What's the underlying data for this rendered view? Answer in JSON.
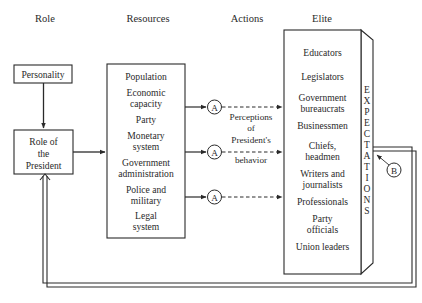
{
  "headers": {
    "role": "Role",
    "resources": "Resources",
    "actions": "Actions",
    "elite": "Elite"
  },
  "role": {
    "personality": "Personality",
    "president_lines": [
      "Role of",
      "the",
      "President"
    ]
  },
  "resources": {
    "items": [
      [
        "Population"
      ],
      [
        "Economic",
        "capacity"
      ],
      [
        "Party"
      ],
      [
        "Monetary",
        "system"
      ],
      [
        "Government",
        "administration"
      ],
      [
        "Police and",
        "military"
      ],
      [
        "Legal",
        "system"
      ]
    ]
  },
  "actions": {
    "node_label": "A",
    "perceptions_lines": [
      "Perceptions",
      "of",
      "President's",
      "behavior"
    ]
  },
  "elite": {
    "items": [
      [
        "Educators"
      ],
      [
        "Legislators"
      ],
      [
        "Government",
        "bureaucrats"
      ],
      [
        "Businessmen"
      ],
      [
        "Chiefs,",
        "headmen"
      ],
      [
        "Writers and",
        "journalists"
      ],
      [
        "Professionals"
      ],
      [
        "Party",
        "officials"
      ],
      [
        "Union leaders"
      ]
    ],
    "side_label": "EXPECTATIONS",
    "side_letters": [
      "E",
      "X",
      "P",
      "E",
      "C",
      "T",
      "A",
      "T",
      "I",
      "O",
      "N",
      "S"
    ]
  },
  "feedback": {
    "node_label": "B"
  },
  "colors": {
    "ink": "#2a2a2a",
    "background": "#ffffff"
  }
}
